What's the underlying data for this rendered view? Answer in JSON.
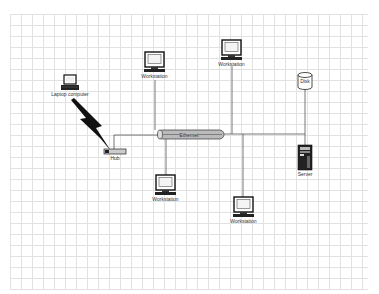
{
  "diagram": {
    "type": "network-diagram",
    "nodes": [
      {
        "id": "laptop",
        "label": "Laptop computer",
        "icon": "laptop-icon"
      },
      {
        "id": "hub",
        "label": "Hub",
        "icon": "hub-icon"
      },
      {
        "id": "ethernet",
        "label": "Ethernet",
        "icon": "ethernet-bus-icon"
      },
      {
        "id": "ws1",
        "label": "Workstation",
        "icon": "workstation-icon"
      },
      {
        "id": "ws2",
        "label": "Workstation",
        "icon": "workstation-icon"
      },
      {
        "id": "ws3",
        "label": "Workstation",
        "icon": "workstation-icon"
      },
      {
        "id": "ws4",
        "label": "Workstation",
        "icon": "workstation-icon"
      },
      {
        "id": "disk",
        "label": "Disk",
        "icon": "database-icon"
      },
      {
        "id": "server",
        "label": "Server",
        "icon": "server-icon"
      }
    ],
    "edges": [
      {
        "from": "laptop",
        "to": "hub",
        "style": "wireless-lightning"
      },
      {
        "from": "hub",
        "to": "ethernet"
      },
      {
        "from": "ws1",
        "to": "ethernet"
      },
      {
        "from": "ws2",
        "to": "ethernet"
      },
      {
        "from": "ws3",
        "to": "ethernet"
      },
      {
        "from": "ws4",
        "to": "ethernet"
      },
      {
        "from": "disk",
        "to": "ethernet"
      },
      {
        "from": "server",
        "to": "ethernet"
      }
    ]
  },
  "colors": {
    "grid": "#e2e2e2",
    "line": "#555555",
    "cylinder": "#b8b8b8"
  }
}
